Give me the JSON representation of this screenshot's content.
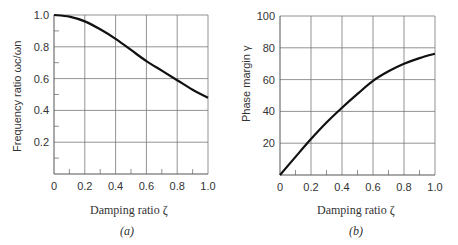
{
  "chart_data": [
    {
      "type": "line",
      "panel": "(a)",
      "title": "",
      "xlabel": "Damping ratio ζ",
      "ylabel": "Frequency ratio ωc/ωn",
      "xlim": [
        0,
        1.0
      ],
      "ylim": [
        0,
        1.0
      ],
      "xticks": [
        "0",
        "0.2",
        "0.4",
        "0.6",
        "0.8",
        "1.0"
      ],
      "yticks": [
        "0.2",
        "0.4",
        "0.6",
        "0.8",
        "1.0"
      ],
      "grid": true,
      "x": [
        0,
        0.1,
        0.2,
        0.3,
        0.4,
        0.5,
        0.6,
        0.7,
        0.8,
        0.9,
        1.0
      ],
      "series": [
        {
          "name": "ωc/ωn",
          "values": [
            1.0,
            0.99,
            0.96,
            0.91,
            0.85,
            0.78,
            0.71,
            0.65,
            0.59,
            0.53,
            0.48
          ]
        }
      ]
    },
    {
      "type": "line",
      "panel": "(b)",
      "title": "",
      "xlabel": "Damping ratio ζ",
      "ylabel": "Phase margin γ",
      "xlim": [
        0,
        1.0
      ],
      "ylim": [
        0,
        100
      ],
      "xticks": [
        "0",
        "0.2",
        "0.4",
        "0.6",
        "0.8",
        "1.0"
      ],
      "yticks": [
        "20",
        "40",
        "60",
        "80",
        "100"
      ],
      "grid": true,
      "x": [
        0,
        0.1,
        0.2,
        0.3,
        0.4,
        0.5,
        0.6,
        0.7,
        0.8,
        0.9,
        1.0
      ],
      "series": [
        {
          "name": "γ",
          "values": [
            0,
            11.4,
            22.6,
            33.0,
            42.3,
            51.0,
            59.2,
            65.2,
            69.9,
            73.5,
            76.3
          ]
        }
      ]
    }
  ],
  "labels": {
    "a": {
      "xlabel": "Damping ratio ζ",
      "ylabel": "Frequency ratio ωc/ωn",
      "caption": "(a)"
    },
    "b": {
      "xlabel": "Damping ratio ζ",
      "ylabel": "Phase margin γ",
      "caption": "(b)"
    }
  }
}
